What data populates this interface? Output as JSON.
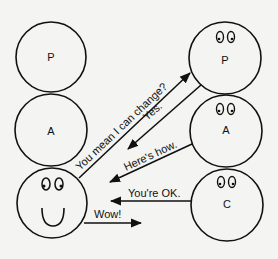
{
  "diagram": {
    "type": "transactional-analysis-ego-states",
    "left_person": {
      "ego_states": [
        {
          "label": "P",
          "has_eyes": false
        },
        {
          "label": "A",
          "has_eyes": false
        },
        {
          "label": "",
          "has_eyes": true,
          "has_smile": true
        }
      ]
    },
    "right_person": {
      "ego_states": [
        {
          "label": "P",
          "has_eyes": true
        },
        {
          "label": "A",
          "has_eyes": true
        },
        {
          "label": "C",
          "has_eyes": true
        }
      ]
    },
    "transactions": [
      {
        "text": "You mean I can change?",
        "from": "left.child",
        "to": "right.parent"
      },
      {
        "text": "Yes.",
        "from": "right.parent",
        "to": "left.child"
      },
      {
        "text": "Here's how.",
        "from": "right.adult",
        "to": "left.child"
      },
      {
        "text": "You're OK.",
        "from": "right.child",
        "to": "left.child"
      },
      {
        "text": "Wow!",
        "from": "left.child",
        "to": "right.child"
      }
    ],
    "colors": {
      "line": "#111111",
      "background": "#f4f4f2"
    }
  }
}
